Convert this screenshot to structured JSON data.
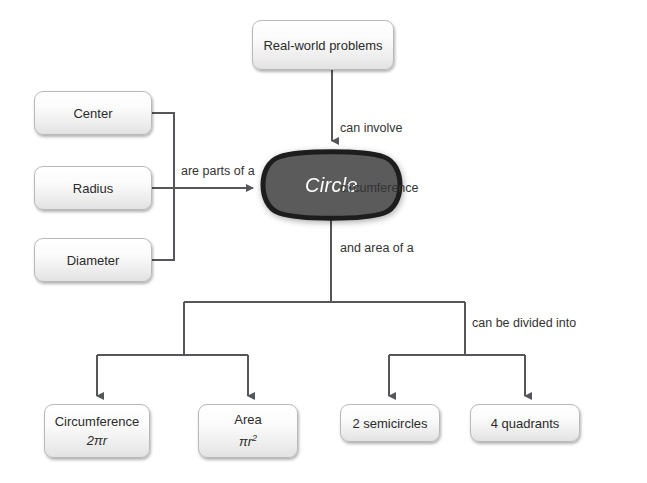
{
  "diagram": {
    "colors": {
      "background": "#ffffff",
      "line": "#55565a",
      "box_border": "#b9b9b9",
      "box_fill_top": "#ffffff",
      "box_fill_bottom": "#e2e2e2",
      "blob_fill": "#5b5b5b",
      "blob_stroke": "#1d1d1d",
      "text": "#2b2b2b",
      "blob_text": "#ffffff"
    },
    "nodes": {
      "real_world": {
        "label": "Real-world problems"
      },
      "center": {
        "label": "Center"
      },
      "radius": {
        "label": "Radius"
      },
      "diameter": {
        "label": "Diameter"
      },
      "circle": {
        "label": "Circle"
      },
      "circumference": {
        "label": "Circumference",
        "formula": "2πr"
      },
      "area": {
        "label": "Area",
        "formula_base": "πr",
        "formula_exp": "2"
      },
      "semicircles": {
        "label": "2 semicircles"
      },
      "quadrants": {
        "label": "4 quadrants"
      }
    },
    "captions": {
      "can_involve_line1": "can involve",
      "can_involve_line2": "circumference",
      "can_involve_line3": "and area of a",
      "are_parts_of_a": "are parts of a",
      "can_be_divided_into": "can be divided into"
    }
  }
}
